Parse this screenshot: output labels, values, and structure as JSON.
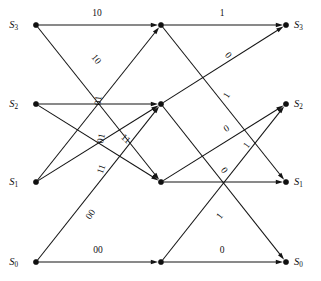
{
  "figure": {
    "kind": "trellis-diagram",
    "width": 321,
    "height": 281,
    "background": "#ffffff",
    "ink_color": "#141414"
  },
  "columns": [
    {
      "id": "col0",
      "x": 36
    },
    {
      "id": "col1",
      "x": 161
    },
    {
      "id": "col2",
      "x": 286
    }
  ],
  "rows": [
    {
      "id": "r3",
      "y": 25
    },
    {
      "id": "r2",
      "y": 104
    },
    {
      "id": "r1",
      "y": 182
    },
    {
      "id": "r0",
      "y": 262
    }
  ],
  "nodes": [
    {
      "name": "n-left-s3",
      "x": 36,
      "y": 25,
      "label": "S",
      "sub": "3",
      "label_side": "left",
      "label_x": 18,
      "label_y": 28
    },
    {
      "name": "n-left-s2",
      "x": 36,
      "y": 104,
      "label": "S",
      "sub": "2",
      "label_side": "left",
      "label_x": 18,
      "label_y": 107
    },
    {
      "name": "n-left-s1",
      "x": 36,
      "y": 182,
      "label": "S",
      "sub": "1",
      "label_side": "left",
      "label_x": 18,
      "label_y": 185
    },
    {
      "name": "n-left-s0",
      "x": 36,
      "y": 262,
      "label": "S",
      "sub": "0",
      "label_side": "left",
      "label_x": 18,
      "label_y": 265
    },
    {
      "name": "n-mid-s3",
      "x": 161,
      "y": 25,
      "label": "",
      "sub": "",
      "label_side": "none",
      "label_x": 0,
      "label_y": 0
    },
    {
      "name": "n-mid-s2",
      "x": 161,
      "y": 104,
      "label": "",
      "sub": "",
      "label_side": "none",
      "label_x": 0,
      "label_y": 0
    },
    {
      "name": "n-mid-s1",
      "x": 161,
      "y": 182,
      "label": "",
      "sub": "",
      "label_side": "none",
      "label_x": 0,
      "label_y": 0
    },
    {
      "name": "n-mid-s0",
      "x": 161,
      "y": 262,
      "label": "",
      "sub": "",
      "label_side": "none",
      "label_x": 0,
      "label_y": 0
    },
    {
      "name": "n-right-s3",
      "x": 286,
      "y": 25,
      "label": "S",
      "sub": "3",
      "label_side": "right",
      "label_x": 294,
      "label_y": 28
    },
    {
      "name": "n-right-s2",
      "x": 286,
      "y": 104,
      "label": "S",
      "sub": "2",
      "label_side": "right",
      "label_x": 294,
      "label_y": 107
    },
    {
      "name": "n-right-s1",
      "x": 286,
      "y": 182,
      "label": "S",
      "sub": "1",
      "label_side": "right",
      "label_x": 294,
      "label_y": 185
    },
    {
      "name": "n-right-s0",
      "x": 286,
      "y": 262,
      "label": "S",
      "sub": "0",
      "label_side": "right",
      "label_x": 294,
      "label_y": 265
    }
  ],
  "edges": [
    {
      "name": "edge-s3-s3-stage1",
      "from": "n-left-s3",
      "to": "n-mid-s3",
      "x1": 36,
      "y1": 25,
      "x2": 161,
      "y2": 25
    },
    {
      "name": "edge-s3-s1-stage1",
      "from": "n-left-s3",
      "to": "n-mid-s1",
      "x1": 36,
      "y1": 25,
      "x2": 161,
      "y2": 182
    },
    {
      "name": "edge-s2-s2-stage1",
      "from": "n-left-s2",
      "to": "n-mid-s2",
      "x1": 36,
      "y1": 104,
      "x2": 161,
      "y2": 104
    },
    {
      "name": "edge-s2-s1-stage1",
      "from": "n-left-s2",
      "to": "n-mid-s1",
      "x1": 36,
      "y1": 104,
      "x2": 161,
      "y2": 182
    },
    {
      "name": "edge-s1-s3-stage1",
      "from": "n-left-s1",
      "to": "n-mid-s3",
      "x1": 36,
      "y1": 182,
      "x2": 161,
      "y2": 25
    },
    {
      "name": "edge-s1-s2-stage1",
      "from": "n-left-s1",
      "to": "n-mid-s2",
      "x1": 36,
      "y1": 182,
      "x2": 161,
      "y2": 104
    },
    {
      "name": "edge-s0-s2-stage1",
      "from": "n-left-s0",
      "to": "n-mid-s2",
      "x1": 36,
      "y1": 262,
      "x2": 161,
      "y2": 104
    },
    {
      "name": "edge-s0-s0-stage1",
      "from": "n-left-s0",
      "to": "n-mid-s0",
      "x1": 36,
      "y1": 262,
      "x2": 161,
      "y2": 262
    },
    {
      "name": "edge-s3-s3-stage2",
      "from": "n-mid-s3",
      "to": "n-right-s3",
      "x1": 161,
      "y1": 25,
      "x2": 286,
      "y2": 25
    },
    {
      "name": "edge-s3-s1-stage2",
      "from": "n-mid-s3",
      "to": "n-right-s1",
      "x1": 161,
      "y1": 25,
      "x2": 286,
      "y2": 182
    },
    {
      "name": "edge-s2-s3-stage2",
      "from": "n-mid-s2",
      "to": "n-right-s3",
      "x1": 161,
      "y1": 104,
      "x2": 286,
      "y2": 25
    },
    {
      "name": "edge-s2-s0-stage2",
      "from": "n-mid-s2",
      "to": "n-right-s0",
      "x1": 161,
      "y1": 104,
      "x2": 286,
      "y2": 262
    },
    {
      "name": "edge-s1-s2-stage2",
      "from": "n-mid-s1",
      "to": "n-right-s2",
      "x1": 161,
      "y1": 182,
      "x2": 286,
      "y2": 104
    },
    {
      "name": "edge-s1-s1-stage2",
      "from": "n-mid-s1",
      "to": "n-right-s1",
      "x1": 161,
      "y1": 182,
      "x2": 286,
      "y2": 182
    },
    {
      "name": "edge-s0-s2-stage2",
      "from": "n-mid-s0",
      "to": "n-right-s2",
      "x1": 161,
      "y1": 262,
      "x2": 286,
      "y2": 104
    },
    {
      "name": "edge-s0-s0-stage2",
      "from": "n-mid-s0",
      "to": "n-right-s0",
      "x1": 161,
      "y1": 262,
      "x2": 286,
      "y2": 262
    }
  ],
  "edge_labels": [
    {
      "name": "label-s3-s3-stage1",
      "text": "10",
      "x": 97,
      "y": 16,
      "rotate": 0,
      "anchor": "middle"
    },
    {
      "name": "label-s3-s1-stage1",
      "text": "10",
      "x": 94,
      "y": 61,
      "rotate": 51,
      "anchor": "middle"
    },
    {
      "name": "label-s1-s3-stage1",
      "text": "01",
      "x": 101,
      "y": 101,
      "rotate": -83,
      "anchor": "middle"
    },
    {
      "name": "label-s2-s2-stage1",
      "text": "01",
      "x": 104,
      "y": 139,
      "rotate": -78,
      "anchor": "middle"
    },
    {
      "name": "label-s2-s1-stage1",
      "text": "11",
      "x": 124,
      "y": 141,
      "rotate": 40,
      "anchor": "middle"
    },
    {
      "name": "label-s1-s2-stage1",
      "text": "11",
      "x": 104,
      "y": 170,
      "rotate": -70,
      "anchor": "middle"
    },
    {
      "name": "label-s0-s2-stage1",
      "text": "00",
      "x": 93,
      "y": 216,
      "rotate": -56,
      "anchor": "middle"
    },
    {
      "name": "label-s0-s0-stage1",
      "text": "00",
      "x": 98,
      "y": 253,
      "rotate": 0,
      "anchor": "middle"
    },
    {
      "name": "label-s3-s3-stage2",
      "text": "1",
      "x": 222,
      "y": 16,
      "rotate": 0,
      "anchor": "middle"
    },
    {
      "name": "label-s3-s1-stage2",
      "text": "0",
      "x": 226,
      "y": 57,
      "rotate": 50,
      "anchor": "middle"
    },
    {
      "name": "label-s2-s3-stage2",
      "text": "1",
      "x": 229,
      "y": 97,
      "rotate": -57,
      "anchor": "middle"
    },
    {
      "name": "label-s1-s2-stage2",
      "text": "0",
      "x": 228,
      "y": 131,
      "rotate": -32,
      "anchor": "middle"
    },
    {
      "name": "label-s0-s2-stage2",
      "text": "1",
      "x": 249,
      "y": 147,
      "rotate": -53,
      "anchor": "middle"
    },
    {
      "name": "label-s2-s0-stage2",
      "text": "0",
      "x": 222,
      "y": 172,
      "rotate": 52,
      "anchor": "middle"
    },
    {
      "name": "label-s0-s2-stage2b",
      "text": "1",
      "x": 222,
      "y": 218,
      "rotate": -52,
      "anchor": "middle"
    },
    {
      "name": "label-s0-s0-stage2",
      "text": "0",
      "x": 222,
      "y": 253,
      "rotate": 0,
      "anchor": "middle"
    }
  ]
}
